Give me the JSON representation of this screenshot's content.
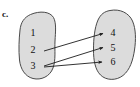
{
  "figure": {
    "part_label": "c.",
    "type": "mapping-diagram",
    "colors": {
      "blob_fill": "#dcdcdc",
      "blob_stroke": "#4a4a4a",
      "arrow": "#1c1c1c",
      "text": "#111111",
      "background": "#ffffff"
    },
    "domain_set": {
      "name": "left-set",
      "elements": [
        {
          "label": "1",
          "x": 33,
          "y": 33
        },
        {
          "label": "2",
          "x": 33,
          "y": 50
        },
        {
          "label": "3",
          "x": 33,
          "y": 66
        }
      ]
    },
    "codomain_set": {
      "name": "right-set",
      "elements": [
        {
          "label": "4",
          "x": 113,
          "y": 33
        },
        {
          "label": "5",
          "x": 113,
          "y": 48
        },
        {
          "label": "6",
          "x": 113,
          "y": 62
        }
      ]
    },
    "arrows": [
      {
        "from": "2",
        "to": "4",
        "x1": 44,
        "y1": 51,
        "x2": 104,
        "y2": 33
      },
      {
        "from": "3",
        "to": "5",
        "x1": 44,
        "y1": 66,
        "x2": 104,
        "y2": 47
      },
      {
        "from": "3",
        "to": "6",
        "x1": 44,
        "y1": 67,
        "x2": 103,
        "y2": 62
      }
    ]
  }
}
